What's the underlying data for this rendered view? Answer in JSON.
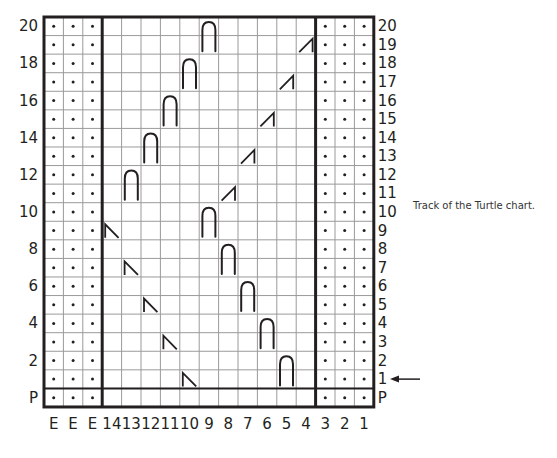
{
  "caption": "Track of the Turtle chart.",
  "row_labels_left": [
    "P",
    "2",
    "4",
    "6",
    "8",
    "10",
    "12",
    "14",
    "16",
    "18",
    "20"
  ],
  "row_labels_right": [
    "P",
    "1",
    "2",
    "3",
    "4",
    "5",
    "6",
    "7",
    "8",
    "9",
    "10",
    "11",
    "12",
    "13",
    "14",
    "15",
    "16",
    "17",
    "18",
    "19",
    "20"
  ],
  "column_labels": [
    "E",
    "E",
    "E",
    "14",
    "13",
    "12",
    "11",
    "10",
    "9",
    "8",
    "7",
    "6",
    "5",
    "4",
    "3",
    "2",
    "1"
  ],
  "current_row_indicator": {
    "row": "1",
    "icon": "left-arrow-icon"
  },
  "sections": {
    "left_edge_columns": [
      "E",
      "E",
      "E"
    ],
    "main_columns": [
      "14",
      "13",
      "12",
      "11",
      "10",
      "9",
      "8",
      "7",
      "6",
      "5",
      "4"
    ],
    "right_edge_columns": [
      "3",
      "2",
      "1"
    ],
    "edge_symbol": "purl-dot"
  },
  "symbols": {
    "cables": [
      {
        "col": "9",
        "rows": [
          "19",
          "20"
        ]
      },
      {
        "col": "10",
        "rows": [
          "17",
          "18"
        ]
      },
      {
        "col": "11",
        "rows": [
          "15",
          "16"
        ]
      },
      {
        "col": "12",
        "rows": [
          "13",
          "14"
        ]
      },
      {
        "col": "13",
        "rows": [
          "11",
          "12"
        ]
      },
      {
        "col": "9",
        "rows": [
          "9",
          "10"
        ]
      },
      {
        "col": "8",
        "rows": [
          "7",
          "8"
        ]
      },
      {
        "col": "7",
        "rows": [
          "5",
          "6"
        ]
      },
      {
        "col": "6",
        "rows": [
          "3",
          "4"
        ]
      },
      {
        "col": "5",
        "rows": [
          "1",
          "2"
        ]
      }
    ],
    "right_slants": [
      {
        "col": "4",
        "row": "19"
      },
      {
        "col": "5",
        "row": "17"
      },
      {
        "col": "6",
        "row": "15"
      },
      {
        "col": "7",
        "row": "13"
      },
      {
        "col": "8",
        "row": "11"
      }
    ],
    "left_slants": [
      {
        "col": "14",
        "row": "9"
      },
      {
        "col": "13",
        "row": "7"
      },
      {
        "col": "12",
        "row": "5"
      },
      {
        "col": "11",
        "row": "3"
      },
      {
        "col": "10",
        "row": "1"
      }
    ]
  },
  "colors": {
    "ink": "#231f20",
    "grid": "#9a9a9a"
  }
}
